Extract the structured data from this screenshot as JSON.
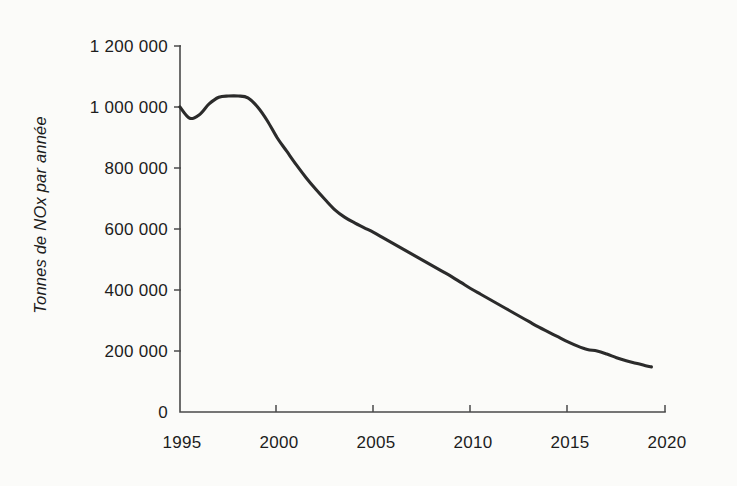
{
  "chart_data": {
    "type": "line",
    "title": "",
    "subtitle": "",
    "xlabel": "",
    "ylabel": "Tonnes de NOx par année",
    "xlim": [
      1995,
      2020
    ],
    "ylim": [
      0,
      1200000
    ],
    "grid": false,
    "legend": null,
    "legend_position": "none",
    "x_ticks": [
      "1995",
      "2000",
      "2005",
      "2010",
      "2015",
      "2020"
    ],
    "x_tick_values": [
      1995,
      2000,
      2005,
      2010,
      2015,
      2020
    ],
    "y_ticks": [
      "0",
      "200 000",
      "400 000",
      "600 000",
      "800 000",
      "1 000 000",
      "1 200 000"
    ],
    "y_tick_values": [
      0,
      200000,
      400000,
      600000,
      800000,
      1000000,
      1200000
    ],
    "series": [
      {
        "name": "Tonnes de NOx par année",
        "color": "#2b2b2b",
        "x": [
          1995.0,
          1995.5,
          1996.0,
          1996.5,
          1997.0,
          1997.5,
          1998.0,
          1998.5,
          1999.0,
          1999.5,
          2000.0,
          2000.5,
          2001.0,
          2001.5,
          2002.0,
          2002.5,
          2003.0,
          2003.5,
          2004.0,
          2004.5,
          2005.0,
          2005.5,
          2006.0,
          2006.5,
          2007.0,
          2007.5,
          2008.0,
          2008.5,
          2009.0,
          2009.5,
          2010.0,
          2010.5,
          2011.0,
          2011.5,
          2012.0,
          2012.5,
          2013.0,
          2013.5,
          2014.0,
          2014.5,
          2015.0,
          2015.5,
          2016.0,
          2016.5,
          2017.0,
          2017.5,
          2018.0,
          2018.5,
          2019.0,
          2019.3
        ],
        "values": [
          1000000,
          963000,
          975000,
          1010000,
          1032000,
          1036000,
          1036000,
          1030000,
          1000000,
          955000,
          900000,
          855000,
          810000,
          768000,
          730000,
          695000,
          662000,
          638000,
          620000,
          604000,
          588000,
          570000,
          552000,
          534000,
          516000,
          498000,
          480000,
          462000,
          444000,
          424000,
          404000,
          386000,
          368000,
          350000,
          332000,
          314000,
          296000,
          278000,
          262000,
          246000,
          230000,
          216000,
          205000,
          200000,
          190000,
          178000,
          168000,
          160000,
          152000,
          148000
        ]
      }
    ],
    "annotations": []
  },
  "figure": {
    "background_color": "#fbfbf9",
    "line_color": "#2b2b2b",
    "axis_color": "#4a4a4a",
    "text_color": "#1d1d1d"
  }
}
